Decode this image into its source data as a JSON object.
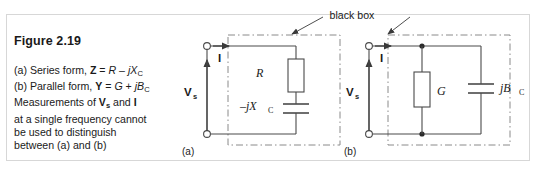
{
  "figure": {
    "title": "Figure 2.19",
    "caption_lines": [
      "(a) Series form, Z = R – jX_C",
      "(b) Parallel form, Y = G + jB_C",
      "Measurements of V_s and I",
      "at a single frequency cannot",
      "be used to distinguish",
      "between (a) and (b)"
    ],
    "caption": {
      "line1_prefix": "(a) Series form, ",
      "line1_z": "Z",
      "line1_eq": " = ",
      "line1_r": "R",
      "line1_minus": " – ",
      "line1_j": "j",
      "line1_x": "X",
      "line1_sub": "C",
      "line2_prefix": "(b) Parallel form, ",
      "line2_y": "Y",
      "line2_eq": " = ",
      "line2_g": "G",
      "line2_plus": " + ",
      "line2_j": "j",
      "line2_b": "B",
      "line2_sub": "C",
      "line3_prefix": "Measurements of ",
      "line3_v": "V",
      "line3_sub": "s",
      "line3_and": " and ",
      "line3_i": "I",
      "line4": "at a single frequency cannot",
      "line5": "be used to distinguish",
      "line6": "between (a) and (b)"
    },
    "black_box_label": "black  box",
    "circuit_a": {
      "panel_label": "(a)",
      "source_label": "V",
      "source_sub": "s",
      "current_label": "I",
      "resistor_label": "R",
      "capacitor_label": "–jX",
      "capacitor_sub": "C"
    },
    "circuit_b": {
      "panel_label": "(b)",
      "source_label": "V",
      "source_sub": "s",
      "current_label": "I",
      "conductance_label": "G",
      "susceptance_label": "jB",
      "susceptance_sub": "C"
    }
  },
  "colors": {
    "ink": "#1a1a1a",
    "wire": "#4a4a4a",
    "frame": "#d7d7d7",
    "background": "#ffffff"
  }
}
